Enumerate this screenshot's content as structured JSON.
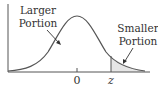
{
  "diagram": {
    "type": "normal-distribution-tail",
    "labels": {
      "larger_line1": "Larger",
      "larger_line2": "Portion",
      "smaller_line1": "Smaller",
      "smaller_line2": "Portion"
    },
    "ticks": {
      "zero": "0",
      "z": "z"
    },
    "colors": {
      "curve": "#555555",
      "axis": "#555555",
      "shade": "#e6e6e6",
      "text": "#333333"
    }
  }
}
